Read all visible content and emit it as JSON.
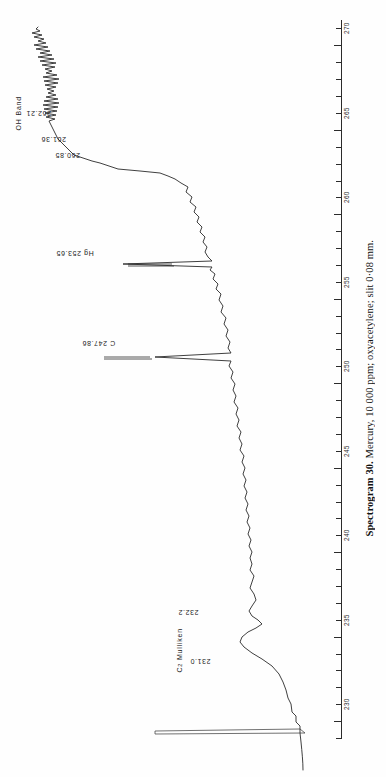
{
  "figure": {
    "caption_label": "Spectrogram 30.",
    "caption_text": " Mercury, 10 000 ppm; oxyacetylene; slit 0·08 mm."
  },
  "axis": {
    "unit": "nm",
    "orientation": "vertical",
    "min": 229.0,
    "max": 271.5,
    "major_step": 5,
    "minor_step": 1,
    "tick_labels": [
      "230",
      "235",
      "240",
      "245",
      "250",
      "255",
      "260",
      "265",
      "270"
    ]
  },
  "annotations": {
    "oh_band": "OH  Band",
    "c2_mulliken_prefix": "C",
    "c2_mulliken_sub": "2",
    "c2_mulliken_suffix": " Mulliken"
  },
  "peaks": [
    {
      "label": "262.21",
      "wavelength": 262.21
    },
    {
      "label": "261.36",
      "wavelength": 261.36
    },
    {
      "label": "260.85",
      "wavelength": 260.85
    },
    {
      "label": "Hg 253.65",
      "wavelength": 253.65
    },
    {
      "label": "C 247.86",
      "wavelength": 247.86
    },
    {
      "label": "232.2",
      "wavelength": 232.2
    },
    {
      "label": "231.0",
      "wavelength": 231.0
    }
  ],
  "chart_data": {
    "type": "line",
    "title": "Spectrogram 30. Mercury, 10 000 ppm; oxyacetylene; slit 0·08 mm.",
    "xlabel": "Wavelength (nm)",
    "ylabel": "Emission intensity (arbitrary units)",
    "xlim": [
      229.0,
      271.5
    ],
    "ylim": [
      0,
      100
    ],
    "grid": false,
    "legend": null,
    "orientation": "wavelength axis vertical, intensity horizontal",
    "series": [
      {
        "name": "Emission trace",
        "x": [
          229.2,
          229.6,
          230.0,
          230.3,
          230.6,
          230.9,
          231.0,
          231.2,
          231.5,
          231.8,
          232.0,
          232.2,
          232.5,
          232.9,
          233.4,
          234.0,
          234.6,
          235.2,
          235.8,
          236.4,
          237.0,
          237.6,
          238.2,
          238.8,
          239.4,
          240.0,
          240.6,
          241.2,
          241.8,
          242.4,
          243.0,
          243.6,
          244.2,
          244.8,
          245.4,
          246.0,
          246.6,
          247.2,
          247.6,
          247.86,
          248.1,
          248.5,
          249.0,
          249.6,
          250.2,
          250.8,
          251.4,
          252.0,
          252.6,
          253.2,
          253.5,
          253.65,
          253.8,
          254.1,
          254.6,
          255.2,
          255.8,
          256.4,
          257.0,
          257.6,
          258.2,
          258.8,
          259.4,
          260.0,
          260.5,
          260.85,
          261.1,
          261.36,
          261.6,
          261.9,
          262.21,
          262.5,
          262.8,
          263.1,
          263.4,
          263.7,
          264.0,
          264.4,
          264.8,
          265.3,
          265.8,
          266.4,
          267.0,
          267.6,
          268.2,
          268.8,
          269.4,
          270.0,
          270.6,
          271.2
        ],
        "y": [
          2,
          2,
          3,
          10,
          26,
          40,
          44,
          38,
          30,
          34,
          44,
          52,
          46,
          38,
          34,
          33,
          34,
          33,
          32,
          34,
          33,
          32,
          34,
          33,
          34,
          33,
          35,
          34,
          35,
          36,
          35,
          37,
          36,
          38,
          37,
          39,
          38,
          40,
          42,
          96,
          44,
          42,
          44,
          43,
          45,
          46,
          48,
          50,
          52,
          55,
          58,
          98,
          60,
          58,
          59,
          58,
          60,
          62,
          64,
          63,
          65,
          67,
          69,
          72,
          74,
          84,
          78,
          88,
          80,
          82,
          92,
          86,
          78,
          84,
          76,
          82,
          74,
          80,
          70,
          78,
          66,
          74,
          62,
          70,
          58,
          66,
          56,
          62,
          54,
          58
        ]
      }
    ],
    "labeled_peaks": [
      {
        "wavelength": 231.0,
        "label": "231.0",
        "species": "C2 Mulliken"
      },
      {
        "wavelength": 232.2,
        "label": "232.2",
        "species": "C2 Mulliken"
      },
      {
        "wavelength": 247.86,
        "label": "C 247.86",
        "species": "C"
      },
      {
        "wavelength": 253.65,
        "label": "Hg 253.65",
        "species": "Hg"
      },
      {
        "wavelength": 260.85,
        "label": "260.85",
        "species": "OH band"
      },
      {
        "wavelength": 261.36,
        "label": "261.36",
        "species": "OH band"
      },
      {
        "wavelength": 262.21,
        "label": "262.21",
        "species": "OH band"
      }
    ]
  }
}
